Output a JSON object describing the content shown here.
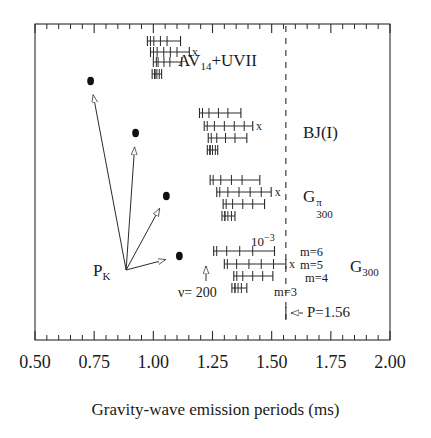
{
  "figure": {
    "xaxis_title": "Gravity-wave emission periods (ms)",
    "tick_labels": [
      "0.50",
      "0.75",
      "1.00",
      "1.25",
      "1.50",
      "1.75",
      "2.00"
    ]
  },
  "annotations": {
    "pk_label": "P",
    "pk_sub": "K",
    "nu_label": "ν= 200",
    "exp_label": "10",
    "exp_sup": "−3",
    "p_line_label": "P=1.56",
    "m6": "m=6",
    "m5": "m=5",
    "m4": "m=4",
    "m3": "m=3"
  },
  "groups": [
    {
      "name": "av14-uvii",
      "label_main": "AV",
      "label_sub": "14",
      "label_tail": "+UVII",
      "label_sup": ""
    },
    {
      "name": "bj-i",
      "label_main": "BJ(I)",
      "label_sub": "",
      "label_tail": "",
      "label_sup": ""
    },
    {
      "name": "g300-pi",
      "label_main": "G",
      "label_sub": "300",
      "label_tail": "",
      "label_sup": "π"
    },
    {
      "name": "g300",
      "label_main": "G",
      "label_sub": "300",
      "label_tail": "",
      "label_sup": ""
    }
  ],
  "chart_data": {
    "type": "scatter",
    "title": "",
    "xlabel": "Gravity-wave emission periods (ms)",
    "ylabel": "",
    "xlim": [
      0.5,
      2.0
    ],
    "xticks": [
      0.5,
      0.75,
      1.0,
      1.25,
      1.5,
      1.75,
      2.0
    ],
    "xtick_labels": [
      "0.50",
      "0.75",
      "1.00",
      "1.25",
      "1.50",
      "1.75",
      "2.00"
    ],
    "minor_ticks_per_interval": 5,
    "grid": false,
    "legend": "inline-labels",
    "vertical_reference_line": {
      "x": 1.56,
      "style": "dashed",
      "label": "P=1.56"
    },
    "pk_origin": {
      "x": 0.885,
      "y_px": 270
    },
    "pk_points": [
      {
        "x": 0.735,
        "y_px": 81
      },
      {
        "x": 0.925,
        "y_px": 133
      },
      {
        "x": 1.055,
        "y_px": 196
      },
      {
        "x": 1.11,
        "y_px": 256
      }
    ],
    "series": [
      {
        "name": "AV14+UVII",
        "label": "AV14+UVII",
        "y_px": 46,
        "x_marker": 1.155,
        "rows": [
          {
            "m": 6,
            "y_px": 41,
            "left": 0.975,
            "right": 1.115,
            "ticks": [
              1.002,
              1.03,
              1.058
            ]
          },
          {
            "m": 5,
            "y_px": 52,
            "left": 0.988,
            "right": 1.152,
            "ticks": [
              1.016,
              1.044,
              1.072,
              1.1
            ]
          },
          {
            "m": 4,
            "y_px": 62,
            "left": 1.0,
            "right": 1.12,
            "ticks": [
              1.02,
              1.045,
              1.07
            ]
          },
          {
            "m": 3,
            "y_px": 74,
            "left": 0.995,
            "right": 1.035,
            "ticks": [
              1.005,
              1.015,
              1.025
            ]
          }
        ]
      },
      {
        "name": "BJ(I)",
        "label": "BJ(I)",
        "y_px": 122,
        "x_marker": 1.425,
        "rows": [
          {
            "m": 6,
            "y_px": 113,
            "left": 1.195,
            "right": 1.37,
            "ticks": [
              1.235,
              1.275,
              1.315
            ]
          },
          {
            "m": 5,
            "y_px": 126,
            "left": 1.215,
            "right": 1.42,
            "ticks": [
              1.258,
              1.3,
              1.342,
              1.384
            ]
          },
          {
            "m": 4,
            "y_px": 138,
            "left": 1.232,
            "right": 1.395,
            "ticks": [
              1.268,
              1.305,
              1.345
            ]
          },
          {
            "m": 3,
            "y_px": 150,
            "left": 1.228,
            "right": 1.272,
            "ticks": [
              1.238,
              1.25,
              1.262
            ]
          }
        ]
      },
      {
        "name": "G300pi",
        "label": "G300^pi",
        "y_px": 190,
        "x_marker": 1.505,
        "rows": [
          {
            "m": 6,
            "y_px": 180,
            "left": 1.24,
            "right": 1.45,
            "ticks": [
              1.285,
              1.33,
              1.375
            ]
          },
          {
            "m": 5,
            "y_px": 192,
            "left": 1.268,
            "right": 1.498,
            "ticks": [
              1.315,
              1.362,
              1.409,
              1.456
            ]
          },
          {
            "m": 4,
            "y_px": 204,
            "left": 1.295,
            "right": 1.47,
            "ticks": [
              1.335,
              1.378,
              1.42
            ]
          },
          {
            "m": 3,
            "y_px": 216,
            "left": 1.29,
            "right": 1.345,
            "ticks": [
              1.302,
              1.315,
              1.33
            ]
          }
        ]
      },
      {
        "name": "G300",
        "label": "G300",
        "y_px": 262,
        "x_marker": 1.565,
        "rows": [
          {
            "m": 6,
            "y_px": 251,
            "left": 1.255,
            "right": 1.512,
            "ticks": [
              1.31,
              1.365,
              1.42
            ]
          },
          {
            "m": 5,
            "y_px": 264,
            "left": 1.3,
            "right": 1.56,
            "ticks": [
              1.352,
              1.404,
              1.456,
              1.508
            ]
          },
          {
            "m": 4,
            "y_px": 276,
            "left": 1.34,
            "right": 1.505,
            "ticks": [
              1.378,
              1.42,
              1.462
            ]
          },
          {
            "m": 3,
            "y_px": 288,
            "left": 1.332,
            "right": 1.395,
            "ticks": [
              1.345,
              1.358,
              1.372
            ]
          }
        ]
      }
    ]
  }
}
